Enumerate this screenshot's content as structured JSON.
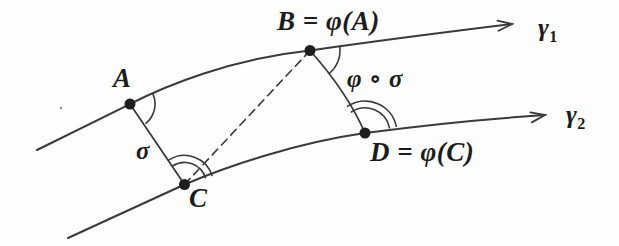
{
  "figure": {
    "type": "geometry-diagram",
    "colors": {
      "background": "#fdfdfd",
      "line": "#3a3a3a",
      "dot": "#1e1e1e",
      "text": "#1c1c1c"
    },
    "labels": {
      "point_a": "A",
      "point_b": "B = φ(A)",
      "point_c": "C",
      "point_d": "D = φ(C)",
      "segment_sigma": "σ",
      "segment_phi_sigma": "φ ∘ σ",
      "curve1_base": "γ",
      "curve1_sub": "1",
      "curve2_base": "γ",
      "curve2_sub": "2"
    }
  }
}
